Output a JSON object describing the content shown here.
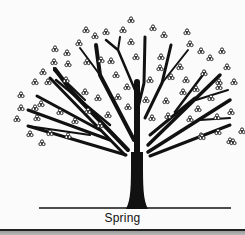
{
  "illustration": {
    "caption": "Spring",
    "colors": {
      "ink": "#111111",
      "background": "#fbfbfb"
    },
    "ground": {
      "x1": 39,
      "x2": 231,
      "y": 208
    },
    "trunk": "M126,209 C131,200 131,185 131,160 L131,152 L143,152 L143,160 C143,185 143,200 148,209 Z",
    "branches": [
      {
        "d": "M137,158 L137,82",
        "w": 6
      },
      {
        "d": "M136,116 L144,83 L145,37",
        "w": 3
      },
      {
        "d": "M135,90 L118,50 L106,40",
        "w": 2.5
      },
      {
        "d": "M118,50 L120,37",
        "w": 2
      },
      {
        "d": "M134,140 L100,75 L96,45",
        "w": 4
      },
      {
        "d": "M100,75 L80,48",
        "w": 2
      },
      {
        "d": "M128,150 L72,92 L55,69",
        "w": 4
      },
      {
        "d": "M72,92 L55,70 L54,68",
        "w": 2
      },
      {
        "d": "M90,110 L54,70",
        "w": 2
      },
      {
        "d": "M110,125 L56,80",
        "w": 2.5
      },
      {
        "d": "M85,100 L54,70",
        "w": 2
      },
      {
        "d": "M125,155 L50,78",
        "w": 3
      },
      {
        "d": "M100,130 L37,96",
        "w": 3
      },
      {
        "d": "M110,140 L28,110",
        "w": 3
      },
      {
        "d": "M90,135 L28,126",
        "w": 2
      },
      {
        "d": "M126,155 L28,126",
        "w": 3
      },
      {
        "d": "M145,118 L162,83 L171,45",
        "w": 3
      },
      {
        "d": "M162,83 L188,50",
        "w": 2
      },
      {
        "d": "M150,135 L195,98",
        "w": 3
      },
      {
        "d": "M175,112 L205,72",
        "w": 2.5
      },
      {
        "d": "M148,145 L220,75",
        "w": 3.5
      },
      {
        "d": "M196,100 L228,90",
        "w": 2
      },
      {
        "d": "M148,152 L230,100",
        "w": 3.5
      },
      {
        "d": "M200,120 L230,118",
        "w": 2
      },
      {
        "d": "M150,156 L230,125",
        "w": 3
      }
    ],
    "blossoms": [
      [
        131,
        20
      ],
      [
        86,
        30
      ],
      [
        95,
        36
      ],
      [
        106,
        32
      ],
      [
        123,
        30
      ],
      [
        153,
        28
      ],
      [
        164,
        35
      ],
      [
        187,
        32
      ],
      [
        79,
        43
      ],
      [
        131,
        42
      ],
      [
        190,
        44
      ],
      [
        201,
        51
      ],
      [
        222,
        51
      ],
      [
        55,
        49
      ],
      [
        67,
        53
      ],
      [
        101,
        60
      ],
      [
        136,
        57
      ],
      [
        161,
        57
      ],
      [
        111,
        61
      ],
      [
        210,
        58
      ],
      [
        54,
        62
      ],
      [
        68,
        64
      ],
      [
        87,
        62
      ],
      [
        227,
        67
      ],
      [
        43,
        72
      ],
      [
        160,
        68
      ],
      [
        180,
        67
      ],
      [
        204,
        73
      ],
      [
        35,
        82
      ],
      [
        48,
        82
      ],
      [
        66,
        80
      ],
      [
        116,
        75
      ],
      [
        150,
        80
      ],
      [
        171,
        77
      ],
      [
        186,
        80
      ],
      [
        219,
        82
      ],
      [
        85,
        92
      ],
      [
        127,
        87
      ],
      [
        219,
        87
      ],
      [
        21,
        95
      ],
      [
        183,
        92
      ],
      [
        196,
        89
      ],
      [
        234,
        82
      ],
      [
        41,
        104
      ],
      [
        98,
        98
      ],
      [
        118,
        97
      ],
      [
        146,
        100
      ],
      [
        166,
        101
      ],
      [
        211,
        98
      ],
      [
        21,
        108
      ],
      [
        35,
        108
      ],
      [
        60,
        112
      ],
      [
        88,
        111
      ],
      [
        108,
        115
      ],
      [
        128,
        107
      ],
      [
        198,
        109
      ],
      [
        231,
        112
      ],
      [
        17,
        119
      ],
      [
        37,
        118
      ],
      [
        75,
        121
      ],
      [
        152,
        118
      ],
      [
        168,
        116
      ],
      [
        190,
        119
      ],
      [
        217,
        117
      ],
      [
        100,
        125
      ],
      [
        30,
        134
      ],
      [
        50,
        133
      ],
      [
        68,
        136
      ],
      [
        201,
        136
      ],
      [
        218,
        132
      ],
      [
        42,
        143
      ],
      [
        242,
        131
      ],
      [
        230,
        141
      ],
      [
        202,
        137
      ],
      [
        233,
        142
      ]
    ]
  }
}
